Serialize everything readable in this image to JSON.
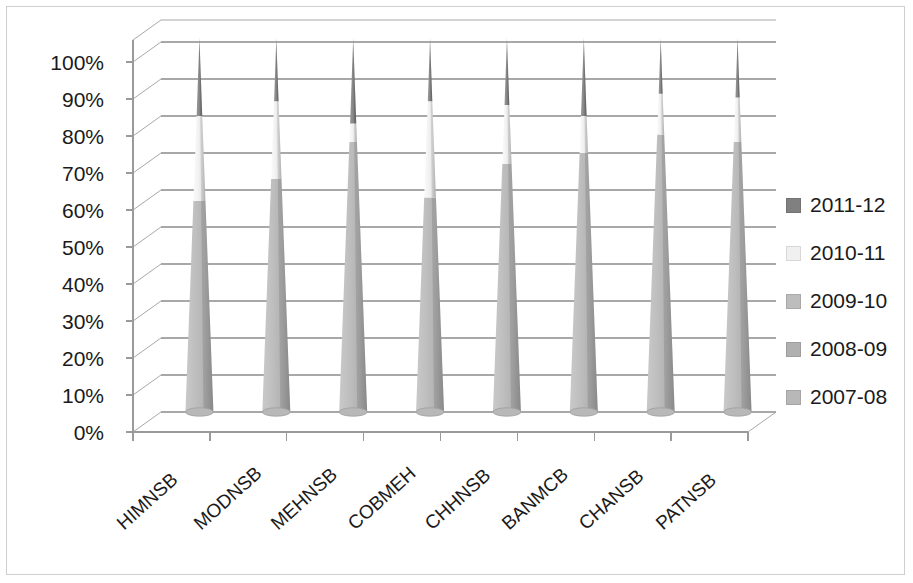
{
  "chart_data": {
    "type": "bar",
    "subtype": "100%-stacked-cone-3d",
    "title": "",
    "subtitle": "",
    "xlabel": "",
    "ylabel": "",
    "ylim": [
      0,
      100
    ],
    "yticks": [
      "0%",
      "10%",
      "20%",
      "30%",
      "40%",
      "50%",
      "60%",
      "70%",
      "80%",
      "90%",
      "100%"
    ],
    "ytick_values": [
      0,
      10,
      20,
      30,
      40,
      50,
      60,
      70,
      80,
      90,
      100
    ],
    "grid": true,
    "legend_position": "right",
    "categories": [
      "HIMNSB",
      "MODNSB",
      "MEHNSB",
      "COBMEH",
      "CHHNSB",
      "BANMCB",
      "CHANSB",
      "PATNSB"
    ],
    "series": [
      {
        "name": "2007-08",
        "color": "#b3b3b3",
        "values": [
          11,
          12,
          12,
          11,
          12,
          12,
          12,
          13
        ]
      },
      {
        "name": "2008-09",
        "color": "#b3b3b3",
        "values": [
          14,
          15,
          15,
          14,
          16,
          15,
          15,
          16
        ]
      },
      {
        "name": "2009-10",
        "color": "#b3b3b3",
        "values": [
          32,
          36,
          46,
          33,
          39,
          43,
          34,
          44
        ]
      },
      {
        "name": "2010-11",
        "color": "#f0f0f0",
        "values": [
          23,
          21,
          5,
          26,
          16,
          10,
          11,
          12
        ]
      },
      {
        "name": "2011-12",
        "color": "#808080",
        "values": [
          20,
          16,
          22,
          16,
          17,
          20,
          28,
          15
        ]
      }
    ],
    "stack_order_bottom_to_top": [
      "2007-08",
      "2008-09",
      "2009-10",
      "2010-11",
      "2011-12"
    ],
    "segment_boundaries_percent": {
      "HIMNSB": {
        "light_top": 80,
        "light_bottom": 57
      },
      "MODNSB": {
        "light_top": 84,
        "light_bottom": 63
      },
      "MEHNSB": {
        "light_top": 78,
        "light_bottom": 73
      },
      "COBMEH": {
        "light_top": 84,
        "light_bottom": 58
      },
      "CHHNSB": {
        "light_top": 83,
        "light_bottom": 67
      },
      "BANMCB": {
        "light_top": 80,
        "light_bottom": 70
      },
      "CHANSB": {
        "light_top": 86,
        "light_bottom": 75
      },
      "PATNSB": {
        "light_top": 85,
        "light_bottom": 73
      }
    }
  },
  "legend": {
    "items": [
      {
        "label": "2011-12",
        "color": "#808080"
      },
      {
        "label": "2010-11",
        "color": "#f0f0f0"
      },
      {
        "label": "2009-10",
        "color": "#bdbdbd"
      },
      {
        "label": "2008-09",
        "color": "#b0b0b0"
      },
      {
        "label": "2007-08",
        "color": "#b8b8b8"
      }
    ]
  },
  "colors": {
    "axis": "#9a9a9a",
    "gridline": "#a8a8a8",
    "text": "#1a1a1a",
    "border": "#cfcfcf",
    "cone_dark": "#808080",
    "cone_light": "#f0f0f0",
    "cone_mid": "#b3b3b3",
    "cone_side_shade": "#8f8f8f",
    "background": "#ffffff"
  }
}
